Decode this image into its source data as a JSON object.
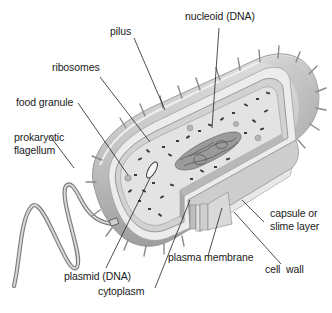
{
  "diagram": {
    "labels": {
      "pilus": "pilus",
      "nucleoid": "nucleoid (DNA)",
      "ribosomes": "ribosomes",
      "food_granule": "food granule",
      "flagellum": "prokaryotic\nflagellum",
      "plasmid": "plasmid (DNA)",
      "cytoplasm": "cytoplasm",
      "plasma_membrane": "plasma membrane",
      "cell_wall": "cell  wall",
      "capsule": "capsule or\nslime layer"
    },
    "colors": {
      "background": "#ffffff",
      "capsule": "#c9c9c9",
      "capsule_dark": "#a8a8a8",
      "cell_wall": "#e6e6e6",
      "cytoplasm": "#dcdcdc",
      "ribosome": "#3a3a3a",
      "nucleoid": "#8a8a8a",
      "text": "#1a1a1a"
    }
  }
}
